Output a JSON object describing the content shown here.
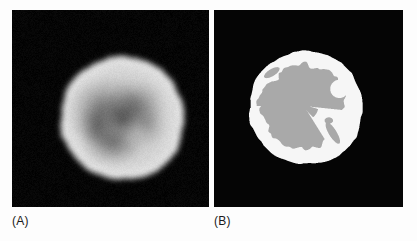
{
  "figure": {
    "width": 417,
    "height": 241,
    "background_color": "#fdfdfd",
    "panel_background_color": "#000000"
  },
  "panels": [
    {
      "id": "panel-a",
      "caption": "(A)",
      "type": "grayscale-blurred-tomographic-slice",
      "description": "Blurred grayscale reconstructed circular phantom slice with bright rim and darker interior lesions",
      "rect": {
        "x": 12,
        "y": 10,
        "width": 197,
        "height": 197
      },
      "caption_position": {
        "x": 12,
        "y": 214
      },
      "object": {
        "shape": "disk",
        "center": {
          "x": 110,
          "y": 108
        },
        "radius": 62,
        "rim_color": "#d8d8d8",
        "interior_color": "#9a9a9a",
        "background_color": "#050505"
      }
    },
    {
      "id": "panel-b",
      "caption": "(B)",
      "type": "segmented-binary-classification-map",
      "description": "Segmented version of the same slice: bright white annular rim region with a large gray interior region and two small gray islands",
      "rect": {
        "x": 214,
        "y": 10,
        "width": 189,
        "height": 197
      },
      "caption_position": {
        "x": 214,
        "y": 214
      },
      "object": {
        "shape": "disk",
        "center": {
          "x": 92,
          "y": 98
        },
        "radius": 57,
        "rim_color": "#f6f6f6",
        "interior_color": "#a9a9a9",
        "background_color": "#050505"
      }
    }
  ],
  "colors": {
    "page": "#fdfdfd",
    "panel_black": "#000000",
    "segment_white": "#f6f6f6",
    "segment_gray": "#a9a9a9",
    "caption_text": "#1a1a1a"
  }
}
